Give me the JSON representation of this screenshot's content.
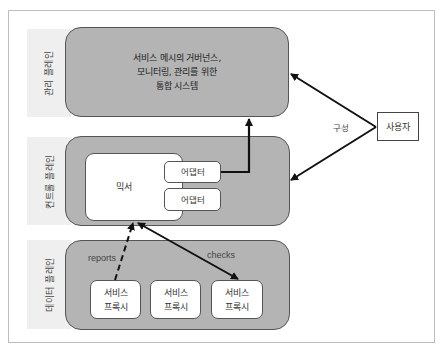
{
  "diagram": {
    "planes": {
      "management": {
        "label": "관리 플레인",
        "description_line1": "서비스 메시의 거버넌스,",
        "description_line2": "모니터링, 관리를 위한",
        "description_line3": "통합 시스템"
      },
      "control": {
        "label": "컨트롤 플레인",
        "mixer": "믹서",
        "adapters": [
          "어댑터",
          "어댑터"
        ]
      },
      "data": {
        "label": "데이터 플레인",
        "proxies": [
          {
            "line1": "서비스",
            "line2": "프록시"
          },
          {
            "line1": "서비스",
            "line2": "프록시"
          },
          {
            "line1": "서비스",
            "line2": "프록시"
          }
        ]
      }
    },
    "user": "사용자",
    "edges": {
      "configure": "구성",
      "reports": "reports",
      "checks": "checks"
    },
    "colors": {
      "plane_fill": "#b4b4b4",
      "band_fill": "#efefef",
      "box_fill": "#ffffff",
      "arrow": "#111111"
    }
  }
}
